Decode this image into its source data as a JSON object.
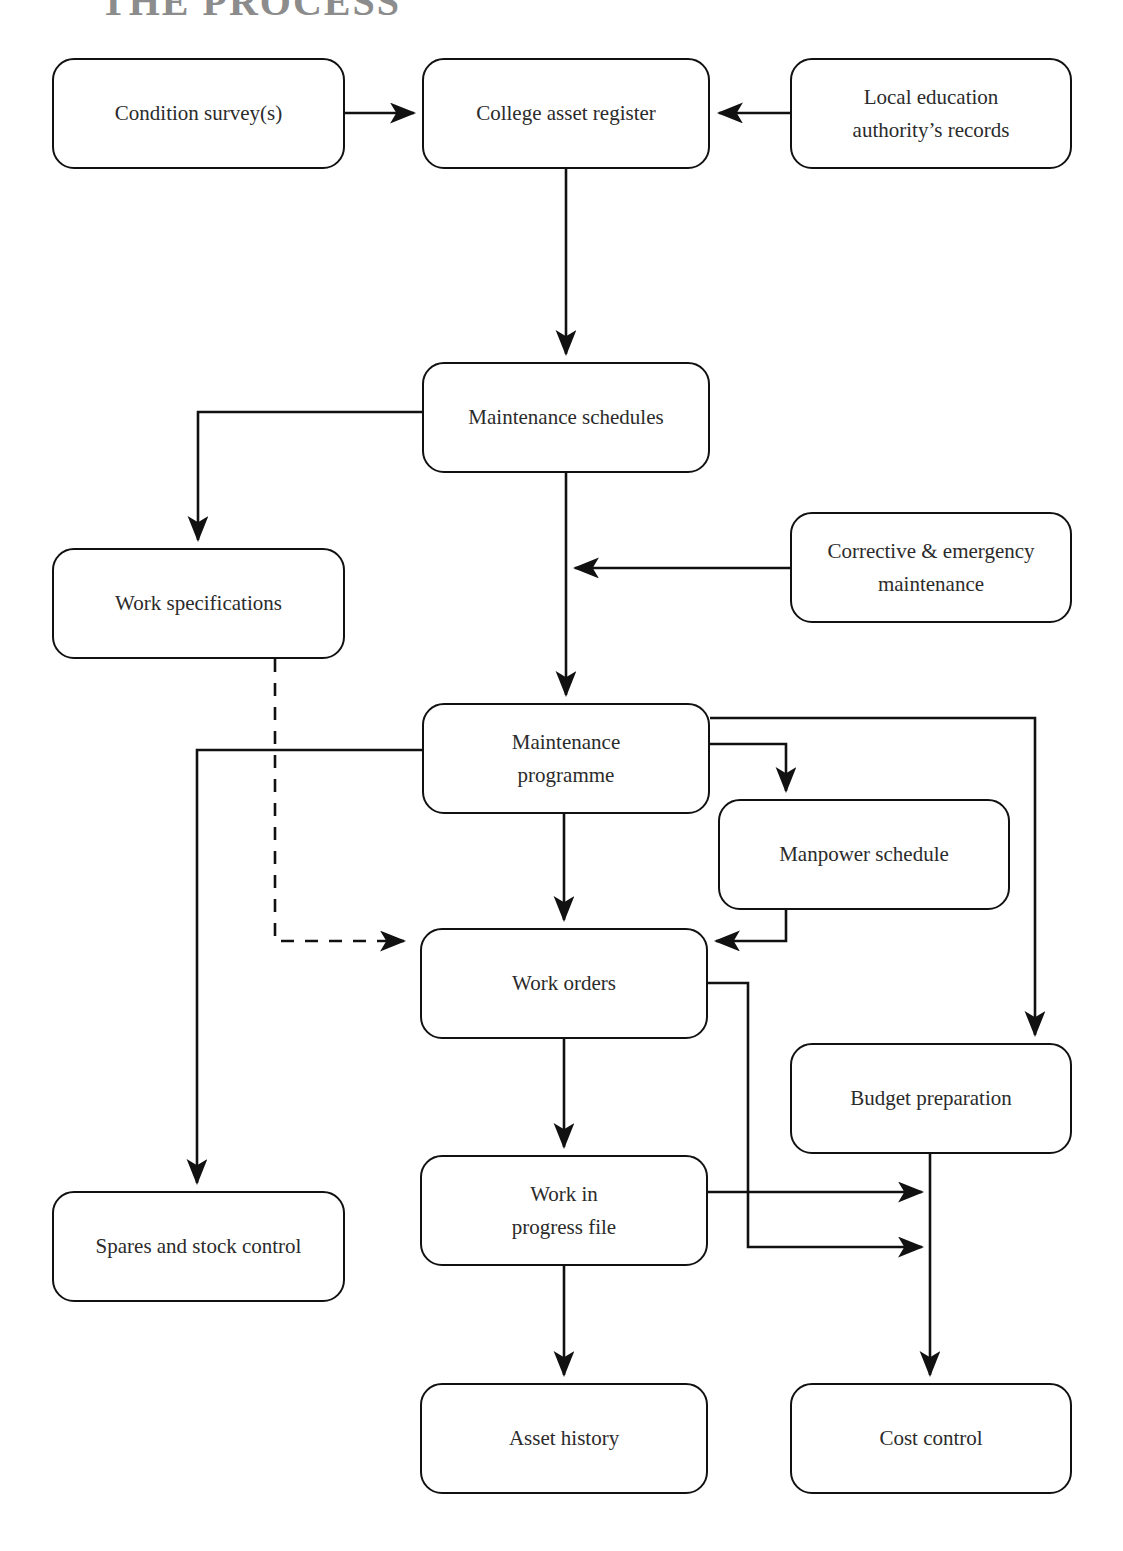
{
  "page": {
    "title": "THE PROCESS",
    "width": 1123,
    "height": 1551,
    "background": "#ffffff",
    "line_color": "#111111",
    "text_color": "#2b2b2b",
    "title_color": "#8c8c8c"
  },
  "diagram": {
    "type": "flowchart",
    "orientation": "top-to-bottom",
    "nodes": [
      {
        "id": "condition_survey",
        "label": "Condition survey(s)",
        "x": 52,
        "y": 58,
        "w": 293,
        "h": 111
      },
      {
        "id": "college_asset",
        "label": "College asset register",
        "x": 422,
        "y": 58,
        "w": 288,
        "h": 111
      },
      {
        "id": "lea_records",
        "label": "Local education\nauthority’s records",
        "x": 790,
        "y": 58,
        "w": 282,
        "h": 111
      },
      {
        "id": "maintenance_sched",
        "label": "Maintenance schedules",
        "x": 422,
        "y": 362,
        "w": 288,
        "h": 111
      },
      {
        "id": "corrective_emerg",
        "label": "Corrective & emergency\nmaintenance",
        "x": 790,
        "y": 512,
        "w": 282,
        "h": 111
      },
      {
        "id": "work_specs",
        "label": "Work specifications",
        "x": 52,
        "y": 548,
        "w": 293,
        "h": 111
      },
      {
        "id": "maintenance_prog",
        "label": "Maintenance\nprogramme",
        "x": 422,
        "y": 703,
        "w": 288,
        "h": 111
      },
      {
        "id": "manpower_sched",
        "label": "Manpower schedule",
        "x": 718,
        "y": 799,
        "w": 292,
        "h": 111
      },
      {
        "id": "work_orders",
        "label": "Work orders",
        "x": 420,
        "y": 928,
        "w": 288,
        "h": 111
      },
      {
        "id": "budget_prep",
        "label": "Budget preparation",
        "x": 790,
        "y": 1043,
        "w": 282,
        "h": 111
      },
      {
        "id": "spares_stock",
        "label": "Spares and stock control",
        "x": 52,
        "y": 1191,
        "w": 293,
        "h": 111
      },
      {
        "id": "work_in_progress",
        "label": "Work in\nprogress file",
        "x": 420,
        "y": 1155,
        "w": 288,
        "h": 111
      },
      {
        "id": "asset_history",
        "label": "Asset history",
        "x": 420,
        "y": 1383,
        "w": 288,
        "h": 111
      },
      {
        "id": "cost_control",
        "label": "Cost control",
        "x": 790,
        "y": 1383,
        "w": 282,
        "h": 111
      }
    ],
    "edges": [
      {
        "id": "e1",
        "from": "condition_survey",
        "to": "college_asset",
        "style": "solid",
        "arrow": true
      },
      {
        "id": "e2",
        "from": "lea_records",
        "to": "college_asset",
        "style": "solid",
        "arrow": true
      },
      {
        "id": "e3",
        "from": "college_asset",
        "to": "maintenance_sched",
        "style": "solid",
        "arrow": true
      },
      {
        "id": "e4",
        "from": "maintenance_sched",
        "to": "work_specs",
        "style": "solid",
        "arrow": true
      },
      {
        "id": "e5",
        "from": "maintenance_sched",
        "to": "maintenance_prog",
        "style": "solid",
        "arrow": true
      },
      {
        "id": "e6",
        "from": "corrective_emerg",
        "to": "maintenance_sched",
        "style": "solid",
        "arrow": true
      },
      {
        "id": "e7",
        "from": "work_specs",
        "to": "work_orders",
        "style": "dashed",
        "arrow": true
      },
      {
        "id": "e8",
        "from": "maintenance_prog",
        "to": "spares_stock",
        "style": "solid",
        "arrow": true
      },
      {
        "id": "e9",
        "from": "maintenance_prog",
        "to": "manpower_sched",
        "style": "solid",
        "arrow": true
      },
      {
        "id": "e10",
        "from": "maintenance_prog",
        "to": "budget_prep",
        "style": "solid",
        "arrow": true
      },
      {
        "id": "e11",
        "from": "maintenance_prog",
        "to": "work_orders",
        "style": "solid",
        "arrow": true
      },
      {
        "id": "e12",
        "from": "manpower_sched",
        "to": "work_orders",
        "style": "solid",
        "arrow": true
      },
      {
        "id": "e13",
        "from": "work_orders",
        "to": "work_in_progress",
        "style": "solid",
        "arrow": true
      },
      {
        "id": "e14",
        "from": "work_orders",
        "to": "cost_control",
        "style": "solid",
        "arrow": true
      },
      {
        "id": "e15",
        "from": "work_in_progress",
        "to": "cost_control",
        "style": "solid",
        "arrow": true
      },
      {
        "id": "e16",
        "from": "work_in_progress",
        "to": "asset_history",
        "style": "solid",
        "arrow": true
      },
      {
        "id": "e17",
        "from": "budget_prep",
        "to": "cost_control",
        "style": "solid",
        "arrow": true
      }
    ]
  }
}
